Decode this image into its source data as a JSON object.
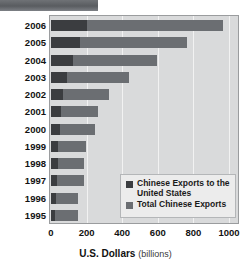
{
  "header": {
    "banner_present": true
  },
  "axis_title": {
    "main": "U.S. Dollars",
    "sub": "(billions)"
  },
  "legend": {
    "items": [
      {
        "label": "Chinese Exports to the United States",
        "color": "#3b3d40",
        "key": "us"
      },
      {
        "label": "Total Chinese Exports",
        "color": "#6b6e72",
        "key": "total"
      }
    ]
  },
  "colors": {
    "exports_to_us": "#3b3d40",
    "total_exports": "#6b6e72",
    "plot_background": "#d9dadb",
    "gridline": "#f2f2f2",
    "frame_border": "#9a9c9e",
    "legend_background": "#ececec",
    "text": "#121212"
  },
  "chart_data": {
    "type": "bar",
    "orientation": "horizontal",
    "title": "",
    "xlabel": "U.S. Dollars (billions)",
    "ylabel": "",
    "xlim": [
      0,
      1000
    ],
    "xticks": [
      0,
      200,
      400,
      600,
      800,
      1000
    ],
    "xtick_labels": [
      "0",
      "200",
      "400",
      "600",
      "800",
      "1000"
    ],
    "grid": true,
    "grid_axis": "x",
    "legend_position": "inside-lower-right",
    "stacked": true,
    "categories": [
      "2006",
      "2005",
      "2004",
      "2003",
      "2002",
      "2001",
      "2000",
      "1999",
      "1998",
      "1997",
      "1996",
      "1995"
    ],
    "series": [
      {
        "name": "Chinese Exports to the United States",
        "color": "#3b3d40",
        "values": [
          203,
          163,
          125,
          92,
          70,
          54,
          52,
          42,
          38,
          33,
          27,
          25
        ]
      },
      {
        "name": "Total Chinese Exports",
        "color": "#6b6e72",
        "values": [
          969,
          762,
          593,
          438,
          326,
          266,
          249,
          195,
          184,
          183,
          151,
          149
        ]
      }
    ]
  }
}
